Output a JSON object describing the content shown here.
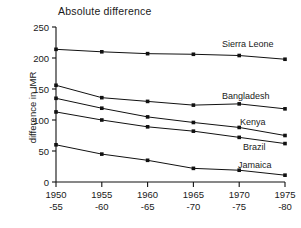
{
  "chart_data": {
    "type": "line",
    "title": "Absolute difference",
    "xlabel": "",
    "ylabel": "difference in IMR",
    "categories": [
      "1950\n-55",
      "1955\n-60",
      "1960\n-65",
      "1965\n-70",
      "1970\n-75",
      "1975\n-80"
    ],
    "x_tick_top": [
      "1950",
      "1955",
      "1960",
      "1965",
      "1970",
      "1975"
    ],
    "x_tick_bottom": [
      "-55",
      "-60",
      "-65",
      "-70",
      "-75",
      "-80"
    ],
    "y_ticks": [
      0,
      50,
      100,
      150,
      200,
      250
    ],
    "ylim": [
      0,
      250
    ],
    "grid": false,
    "legend_position": "right-inline",
    "series": [
      {
        "name": "Sierra Leone",
        "values": [
          214,
          210,
          207,
          206,
          204,
          198
        ]
      },
      {
        "name": "Bangladesh",
        "values": [
          156,
          136,
          130,
          124,
          126,
          118
        ]
      },
      {
        "name": "Kenya",
        "values": [
          135,
          119,
          105,
          96,
          88,
          75
        ]
      },
      {
        "name": "Brazil",
        "values": [
          113,
          100,
          89,
          82,
          72,
          62
        ]
      },
      {
        "name": "Jamaica",
        "values": [
          60,
          45,
          35,
          22,
          19,
          11
        ]
      }
    ],
    "series_label_positions": [
      {
        "name": "Sierra Leone",
        "x": 222,
        "y": 47
      },
      {
        "name": "Bangladesh",
        "x": 222,
        "y": 99
      },
      {
        "name": "Kenya",
        "x": 240,
        "y": 125
      },
      {
        "name": "Brazil",
        "x": 243,
        "y": 150
      },
      {
        "name": "Jamaica",
        "x": 238,
        "y": 168
      }
    ],
    "colors": {
      "line": "#111111",
      "marker": "#111111",
      "background": "#ffffff"
    }
  }
}
